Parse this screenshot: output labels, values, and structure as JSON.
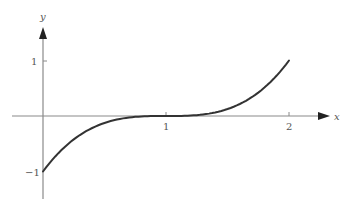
{
  "chart_data": {
    "type": "line",
    "title": "",
    "xlabel": "x",
    "ylabel": "y",
    "function": "y = (x - 1)^3",
    "xlim": [
      0,
      2
    ],
    "ylim": [
      -1,
      1
    ],
    "x_ticks": [
      1,
      2
    ],
    "x_tick_labels": [
      "1",
      "2"
    ],
    "y_ticks": [
      1,
      -1
    ],
    "y_tick_labels": [
      "1",
      "−1"
    ],
    "grid": false,
    "legend": null,
    "series": [
      {
        "name": "curve",
        "x": [
          0,
          0.25,
          0.5,
          0.75,
          1,
          1.25,
          1.5,
          1.75,
          2
        ],
        "y": [
          -1,
          -0.422,
          -0.125,
          -0.016,
          0,
          0.016,
          0.125,
          0.422,
          1
        ]
      }
    ],
    "colors": {
      "curve": "#333333",
      "axes": "#888888"
    }
  },
  "labels": {
    "x_axis": "x",
    "y_axis": "y",
    "x_tick_1": "1",
    "x_tick_2": "2",
    "y_tick_pos1": "1",
    "y_tick_neg1": "−1"
  }
}
